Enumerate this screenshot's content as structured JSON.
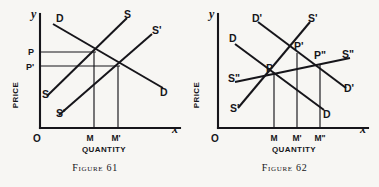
{
  "page": {
    "background_color": "#f7f6f3",
    "ink_color": "#16151a"
  },
  "figures": [
    {
      "id": "figure-61",
      "caption": "Figure 61",
      "axes": {
        "y_axis_label": "y",
        "x_axis_label": "x",
        "origin_label": "O",
        "y_axis_title": "PRICE",
        "x_axis_title": "QUANTITY"
      },
      "price_ticks": [
        {
          "label": "P",
          "y_value": 52
        },
        {
          "label": "P'",
          "y_value": 66
        }
      ],
      "quantity_ticks": [
        {
          "label": "M",
          "x_value": 93
        },
        {
          "label": "M'",
          "x_value": 117
        }
      ],
      "curves": [
        {
          "name": "D",
          "role": "demand",
          "label_top": "D",
          "label_bottom": "D"
        },
        {
          "name": "S",
          "role": "supply",
          "label_top": "S",
          "label_bottom": "S"
        },
        {
          "name": "S'",
          "role": "supply-shifted",
          "label_top": "S'",
          "label_bottom": "S'"
        }
      ],
      "equilibria": [
        {
          "price": "P",
          "quantity": "M"
        },
        {
          "price": "P'",
          "quantity": "M'"
        }
      ]
    },
    {
      "id": "figure-62",
      "caption": "Figure 62",
      "axes": {
        "y_axis_label": "y",
        "x_axis_label": "x",
        "origin_label": "O",
        "y_axis_title": "PRICE",
        "x_axis_title": "QUANTITY"
      },
      "price_ticks": [],
      "quantity_ticks": [
        {
          "label": "M",
          "x_value": 274
        },
        {
          "label": "M'",
          "x_value": 297
        },
        {
          "label": "M\"",
          "x_value": 320
        }
      ],
      "curves": [
        {
          "name": "D",
          "role": "demand",
          "label_top": "D",
          "label_bottom": "D"
        },
        {
          "name": "D'",
          "role": "demand-shifted",
          "label_top": "D'",
          "label_bottom": "D'"
        },
        {
          "name": "S'",
          "role": "supply-steep",
          "label_top": "S'",
          "label_bottom": "S'"
        },
        {
          "name": "S\"",
          "role": "supply-flat",
          "label_top": "S\"",
          "label_bottom": "S\""
        }
      ],
      "equilibrium_points": [
        {
          "label": "P",
          "quantity": "M"
        },
        {
          "label": "P'",
          "quantity": "M'"
        },
        {
          "label": "P\"",
          "quantity": "M\""
        }
      ]
    }
  ]
}
